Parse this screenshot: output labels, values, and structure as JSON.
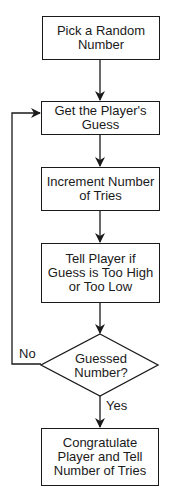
{
  "diagram": {
    "type": "flowchart",
    "nodes": [
      {
        "id": "n1",
        "shape": "rectangle",
        "label": "Pick a Random Number"
      },
      {
        "id": "n2",
        "shape": "rectangle",
        "label": "Get the Player's Guess"
      },
      {
        "id": "n3",
        "shape": "rectangle",
        "label": "Increment Number of Tries"
      },
      {
        "id": "n4",
        "shape": "rectangle",
        "label": "Tell Player if Guess is Too High or Too Low"
      },
      {
        "id": "n5",
        "shape": "diamond",
        "label": "Guessed Number?"
      },
      {
        "id": "n6",
        "shape": "rectangle",
        "label": "Congratulate Player and Tell Number of Tries"
      }
    ],
    "edges": [
      {
        "from": "n1",
        "to": "n2",
        "label": ""
      },
      {
        "from": "n2",
        "to": "n3",
        "label": ""
      },
      {
        "from": "n3",
        "to": "n4",
        "label": ""
      },
      {
        "from": "n4",
        "to": "n5",
        "label": ""
      },
      {
        "from": "n5",
        "to": "n2",
        "label": "No"
      },
      {
        "from": "n5",
        "to": "n6",
        "label": "Yes"
      }
    ],
    "colors": {
      "stroke": "#1a1a1a",
      "background": "#ffffff"
    }
  }
}
